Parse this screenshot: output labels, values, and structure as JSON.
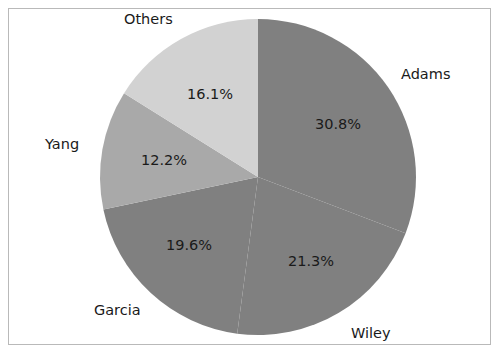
{
  "chart_data": {
    "type": "pie",
    "title": "",
    "labels": [
      "Adams",
      "Wiley",
      "Garcia",
      "Yang",
      "Others"
    ],
    "values": [
      30.8,
      21.3,
      19.6,
      12.2,
      16.1
    ],
    "value_labels": [
      "30.8%",
      "21.3%",
      "19.6%",
      "12.2%",
      "16.1%"
    ],
    "units": "percent",
    "start_angle_deg": 0,
    "direction": "clockwise",
    "legend": "none",
    "grid": false,
    "slice_colors": [
      "#808080",
      "#808080",
      "#808080",
      "#a9a9a9",
      "#d2d2d2"
    ],
    "slices": [
      {
        "name": "Adams",
        "value": 30.8,
        "value_label": "30.8%",
        "color": "#808080",
        "start_deg": 0.0,
        "end_deg": 110.88
      },
      {
        "name": "Wiley",
        "value": 21.3,
        "value_label": "21.3%",
        "color": "#808080",
        "start_deg": 110.88,
        "end_deg": 187.56
      },
      {
        "name": "Garcia",
        "value": 19.6,
        "value_label": "19.6%",
        "color": "#808080",
        "start_deg": 187.56,
        "end_deg": 258.12
      },
      {
        "name": "Yang",
        "value": 12.2,
        "value_label": "12.2%",
        "color": "#a9a9a9",
        "start_deg": 258.12,
        "end_deg": 302.04
      },
      {
        "name": "Others",
        "value": 16.1,
        "value_label": "16.1%",
        "color": "#d2d2d2",
        "start_deg": 302.04,
        "end_deg": 360.0
      }
    ]
  },
  "figure": {
    "border_color": "#b9b9b9",
    "background": "#ffffff",
    "text_color": "#1a1a1a"
  }
}
